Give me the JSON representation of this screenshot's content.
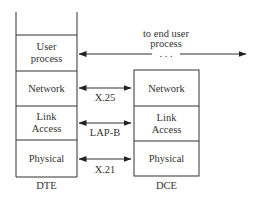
{
  "dte": {
    "label": "DTE",
    "layers": [
      "User process",
      "Network",
      "Link Access",
      "Physical"
    ]
  },
  "dce": {
    "label": "DCE",
    "layers": [
      "Network",
      "Link Access",
      "Physical"
    ]
  },
  "protocols": {
    "network": "X.25",
    "link": "LAP-B",
    "physical": "X.21"
  },
  "end_user": {
    "line1": "to end user",
    "line2": "process",
    "dots": ". . ."
  }
}
